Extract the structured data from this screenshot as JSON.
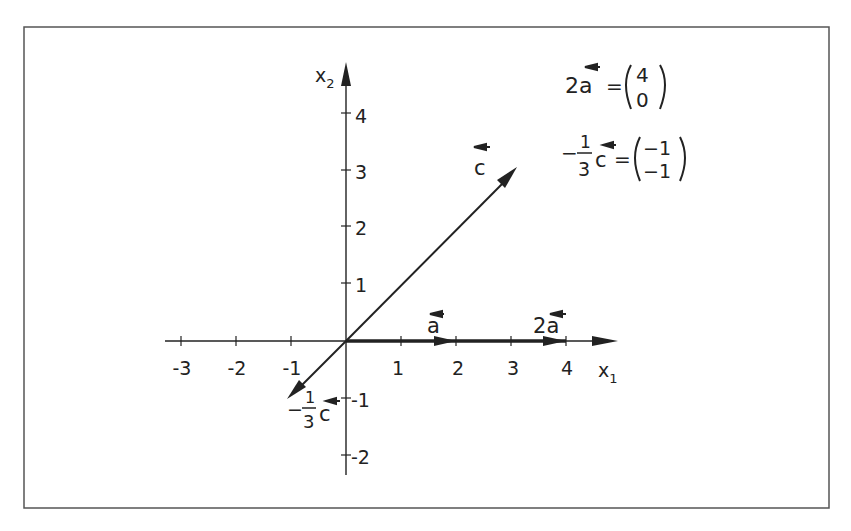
{
  "diagram": {
    "axes": {
      "x_label": "x",
      "x_sub": "1",
      "y_label": "x",
      "y_sub": "2",
      "x_ticks": [
        "-3",
        "-2",
        "-1",
        "1",
        "2",
        "3",
        "4"
      ],
      "y_ticks": [
        "4",
        "3",
        "2",
        "1",
        "-1",
        "-2"
      ]
    },
    "vectors": {
      "a": {
        "name": "a",
        "components": [
          2,
          0
        ]
      },
      "two_a": {
        "name": "2a",
        "coef": "2",
        "components": [
          4,
          0
        ]
      },
      "c": {
        "name": "c",
        "components": [
          3,
          3
        ]
      },
      "neg_third_c": {
        "name": "-1/3 c",
        "sign": "−",
        "num": "1",
        "den": "3",
        "components": [
          -1,
          -1
        ]
      }
    },
    "equations": {
      "eq1": {
        "lhs_coef": "2",
        "lhs_var": "a",
        "equals": "=",
        "top": "4",
        "bottom": "0"
      },
      "eq2": {
        "sign": "−",
        "num": "1",
        "den": "3",
        "var": "c",
        "equals": "=",
        "top": "−1",
        "bottom": "−1"
      }
    },
    "colors": {
      "ink": "#222222",
      "frame": "#555555",
      "background": "#ffffff"
    }
  }
}
